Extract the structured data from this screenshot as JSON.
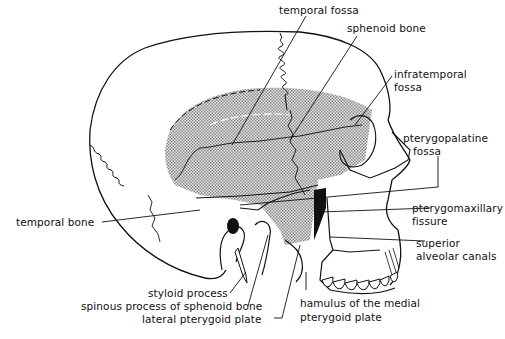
{
  "figure": {
    "colors": {
      "line": "#111111",
      "shade": "#bdbdbd",
      "background": "#ffffff"
    }
  },
  "labels": {
    "temporal_fossa": "temporal fossa",
    "sphenoid_bone": "sphenoid bone",
    "infratemporal_fossa_1": "infratemporal",
    "infratemporal_fossa_2": "fossa",
    "pterygopalatine_fossa_1": "pterygopalatine",
    "pterygopalatine_fossa_2": "fossa",
    "pterygomaxillary_fissure_1": "pterygomaxillary",
    "pterygomaxillary_fissure_2": "fissure",
    "superior_alveolar_canals_1": "superior",
    "superior_alveolar_canals_2": "alveolar canals",
    "temporal_bone": "temporal bone",
    "styloid_process": "styloid process",
    "spinous_process": "spinous process of sphenoid bone",
    "lateral_pterygoid_plate": "lateral pterygoid plate",
    "hamulus_1": "hamulus of the medial",
    "hamulus_2": "pterygoid plate"
  }
}
